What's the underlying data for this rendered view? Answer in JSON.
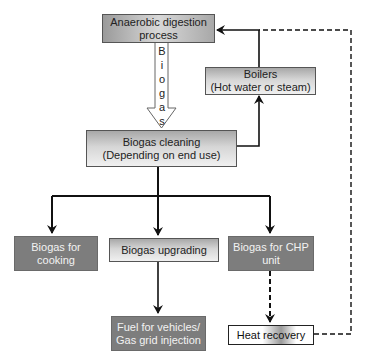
{
  "diagram": {
    "nodes": {
      "anaerobic": {
        "line1": "Anaerobic digestion",
        "line2": "process"
      },
      "boilers": {
        "line1": "Boilers",
        "line2": "(Hot water or steam)"
      },
      "cleaning": {
        "line1": "Biogas cleaning",
        "line2": "(Depending on end use)"
      },
      "cooking": {
        "line1": "Biogas for",
        "line2": "cooking"
      },
      "upgrading": {
        "line1": "Biogas upgrading"
      },
      "chp": {
        "line1": "Biogas for CHP",
        "line2": "unit"
      },
      "fuel": {
        "line1": "Fuel for vehicles/",
        "line2": "Gas grid injection"
      },
      "heat": {
        "line1": "Heat recovery"
      }
    },
    "biogas_arrow_label": [
      "B",
      "i",
      "o",
      "g",
      "a",
      "s"
    ],
    "edges": [
      {
        "from": "anaerobic",
        "to": "cleaning",
        "style": "hollow-arrow",
        "label": "Biogas"
      },
      {
        "from": "cleaning",
        "to": "boilers",
        "style": "solid"
      },
      {
        "from": "boilers",
        "to": "anaerobic",
        "style": "solid"
      },
      {
        "from": "cleaning",
        "to": "cooking",
        "style": "solid"
      },
      {
        "from": "cleaning",
        "to": "upgrading",
        "style": "solid"
      },
      {
        "from": "cleaning",
        "to": "chp",
        "style": "solid"
      },
      {
        "from": "upgrading",
        "to": "fuel",
        "style": "solid"
      },
      {
        "from": "chp",
        "to": "heat",
        "style": "dashed"
      },
      {
        "from": "heat",
        "to": "anaerobic",
        "style": "dashed"
      }
    ]
  }
}
